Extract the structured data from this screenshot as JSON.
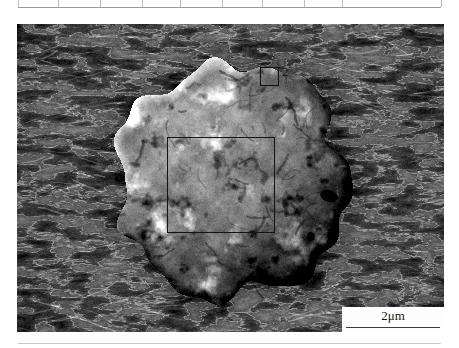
{
  "figure": {
    "type": "sem-micrograph",
    "modality": "scanning electron microscopy",
    "frame": {
      "x": 17,
      "y": 24,
      "width": 427,
      "height": 308
    },
    "background_description": "fibrous filamentous substrate texture"
  },
  "scalebar": {
    "label": "2μm",
    "value": 2,
    "unit": "μm",
    "bar_length_px": 94,
    "position": "bottom-right",
    "box_fill": "#fdfdfd",
    "line_color": "#3a3a3a"
  },
  "annotations": [
    {
      "id": "roi-box-small",
      "label": "2",
      "shape": "rectangle",
      "x": 243,
      "y": 43,
      "width": 19,
      "height": 19,
      "stroke": "#101010"
    },
    {
      "id": "roi-box-large",
      "label": "",
      "shape": "rectangle",
      "x": 150,
      "y": 113,
      "width": 108,
      "height": 96,
      "stroke": "#141414"
    }
  ],
  "particle": {
    "shape": "spheroidal",
    "center_x": 215,
    "center_y": 156,
    "radius_x": 116,
    "radius_y": 118,
    "description": "rough spheroidal particle with bright crystalline surface deposits"
  },
  "table_strip": {
    "rule_color": "#9a9a9a",
    "tick_color": "#bdbdbd",
    "tick_positions": [
      18,
      58,
      100,
      142,
      180,
      222,
      262,
      304,
      342,
      441
    ]
  },
  "colors": {
    "page_background": "#ffffff",
    "ink": "#1a1a1a",
    "sem_mid_gray": "#6e6e6e",
    "sem_highlight": "#f2f2f2",
    "sem_shadow": "#1e1e1e"
  }
}
